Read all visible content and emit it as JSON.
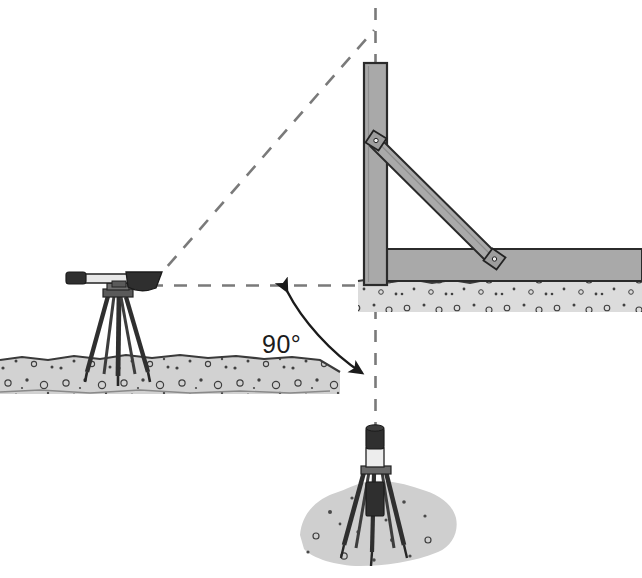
{
  "diagram": {
    "background_color": "#ffffff",
    "width": 642,
    "height": 578,
    "annotations": {
      "angle_label": "90°",
      "angle_value": 90,
      "angle_unit": "degrees"
    },
    "colors": {
      "timber_fill": "#a9a9a9",
      "timber_stroke": "#2b2b2b",
      "ground_fill": "#d2d2d2",
      "ground_stroke": "#3a3a3a",
      "mound_fill": "#cfcfcf",
      "dashed_line": "#7a7a7a",
      "arc_stroke": "#1b1b1b",
      "instrument_dark": "#2f2f2f",
      "instrument_light": "#e8e8e8",
      "text": "#1b1b1b",
      "gravel_speck": "#4a4a4a"
    },
    "elements": {
      "level_instrument": "surveyors-level-on-tripod",
      "target_pole": "tripod-target-pole",
      "post": "vertical-formwork-post",
      "brace": "diagonal-brace",
      "ledger": "horizontal-formwork-member",
      "joint_upper": "brace-upper-joint-plate",
      "joint_lower": "brace-lower-joint-plate",
      "sight_line_horizontal": "horizontal-sight-line",
      "sight_line_inclined": "inclined-sight-line",
      "plumb_line": "vertical-plumb-line",
      "angle_arc": "ninety-degree-arc"
    }
  }
}
